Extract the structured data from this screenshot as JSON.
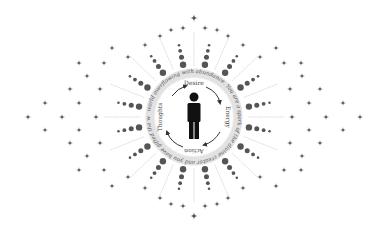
{
  "illustration": {
    "center": [
      194,
      117
    ],
    "colors": {
      "background": "#ffffff",
      "figure": "#111111",
      "dots": "#555555",
      "stars": "#555555",
      "ring": "#dddddd",
      "rays": "#cccccc",
      "arrows": "#333333"
    },
    "figure_icon": "person-standing-icon",
    "cycle_labels": [
      "Desire",
      "Energy",
      "Action",
      "Thoughts"
    ],
    "ring_text": "world overflowing with abundance. You are a spark of the divine creator and you have gifted the world your life's purpose to share"
  }
}
